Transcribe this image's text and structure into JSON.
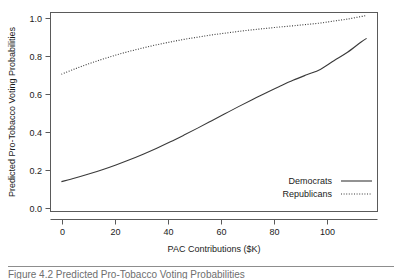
{
  "figure": {
    "caption": "Figure 4.2    Predicted Pro-Tobacco Voting Probabilities"
  },
  "chart_data": {
    "type": "line",
    "title": "",
    "xlabel": "PAC Contributions ($K)",
    "ylabel": "Predicted Pro-Tobacco Voting Probabilities",
    "xlim": [
      -4,
      116
    ],
    "ylim": [
      0.0,
      1.0
    ],
    "xticks": [
      0,
      20,
      40,
      60,
      80,
      100
    ],
    "xtick_labels": [
      "0",
      "20",
      "40",
      "60",
      "80",
      "100"
    ],
    "yticks": [
      0.0,
      0.2,
      0.4,
      0.6,
      0.8,
      1.0
    ],
    "ytick_labels": [
      "0.0",
      "0.2",
      "0.4",
      "0.6",
      "0.8",
      "1.0"
    ],
    "grid": false,
    "legend_position": "bottom-right",
    "x": [
      0,
      5,
      10,
      15,
      20,
      25,
      30,
      35,
      40,
      45,
      50,
      55,
      60,
      65,
      70,
      75,
      80,
      85,
      90,
      95,
      100,
      105,
      110,
      112
    ],
    "series": [
      {
        "name": "Democrats",
        "style": "solid",
        "color": "#3a3a3a",
        "values": [
          0.15,
          0.168,
          0.188,
          0.21,
          0.234,
          0.26,
          0.288,
          0.318,
          0.35,
          0.384,
          0.419,
          0.455,
          0.491,
          0.527,
          0.562,
          0.596,
          0.628,
          0.659,
          0.687,
          0.714,
          0.758,
          0.8,
          0.852,
          0.87
        ]
      },
      {
        "name": "Republicans",
        "style": "dotted",
        "color": "#3a3a3a",
        "values": [
          0.69,
          0.717,
          0.742,
          0.765,
          0.786,
          0.805,
          0.822,
          0.838,
          0.852,
          0.865,
          0.876,
          0.887,
          0.896,
          0.905,
          0.913,
          0.92,
          0.927,
          0.933,
          0.94,
          0.947,
          0.957,
          0.967,
          0.98,
          0.985
        ]
      }
    ],
    "legend": [
      {
        "label": "Democrats",
        "style": "solid"
      },
      {
        "label": "Republicans",
        "style": "dotted"
      }
    ]
  }
}
